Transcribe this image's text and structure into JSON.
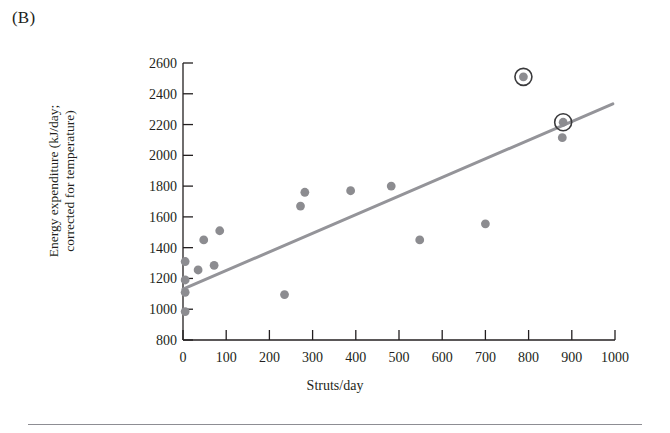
{
  "figure": {
    "panel_label": "(B)",
    "xlabel": "Struts/day",
    "ylabel_line1": "Energy expenditure (kJ/day;",
    "ylabel_line2": "corrected for temperature)",
    "point_color": "#8c8c90",
    "highlight_ring_color": "#3a3a3c",
    "line_color": "#949499",
    "axis_color": "#231f20"
  },
  "chart_data": {
    "type": "scatter",
    "title": "(B)",
    "xlabel": "Struts/day",
    "ylabel": "Energy expenditure (kJ/day; corrected for temperature)",
    "xlim": [
      0,
      1000
    ],
    "ylim": [
      800,
      2600
    ],
    "xticks": [
      0,
      100,
      200,
      300,
      400,
      500,
      600,
      700,
      800,
      900,
      1000
    ],
    "yticks": [
      800,
      1000,
      1200,
      1400,
      1600,
      1800,
      2000,
      2200,
      2400,
      2600
    ],
    "grid": false,
    "legend": "none",
    "series": [
      {
        "name": "Individuals",
        "marker": "filled-circle",
        "color": "#8c8c90",
        "points": [
          {
            "x": 5,
            "y": 1310,
            "highlighted": false
          },
          {
            "x": 5,
            "y": 1190,
            "highlighted": false
          },
          {
            "x": 5,
            "y": 1110,
            "highlighted": false
          },
          {
            "x": 5,
            "y": 985,
            "highlighted": false
          },
          {
            "x": 35,
            "y": 1255,
            "highlighted": false
          },
          {
            "x": 48,
            "y": 1450,
            "highlighted": false
          },
          {
            "x": 72,
            "y": 1285,
            "highlighted": false
          },
          {
            "x": 85,
            "y": 1510,
            "highlighted": false
          },
          {
            "x": 235,
            "y": 1095,
            "highlighted": false
          },
          {
            "x": 272,
            "y": 1670,
            "highlighted": false
          },
          {
            "x": 282,
            "y": 1760,
            "highlighted": false
          },
          {
            "x": 388,
            "y": 1770,
            "highlighted": false
          },
          {
            "x": 482,
            "y": 1800,
            "highlighted": false
          },
          {
            "x": 548,
            "y": 1450,
            "highlighted": false
          },
          {
            "x": 700,
            "y": 1555,
            "highlighted": false
          },
          {
            "x": 878,
            "y": 2115,
            "highlighted": false
          },
          {
            "x": 788,
            "y": 2510,
            "highlighted": true
          },
          {
            "x": 880,
            "y": 2215,
            "highlighted": true
          }
        ]
      }
    ],
    "trendline": {
      "name": "Regression line",
      "color": "#949499",
      "x_start": 0,
      "y_start": 1130,
      "x_end": 995,
      "y_end": 2335
    }
  }
}
